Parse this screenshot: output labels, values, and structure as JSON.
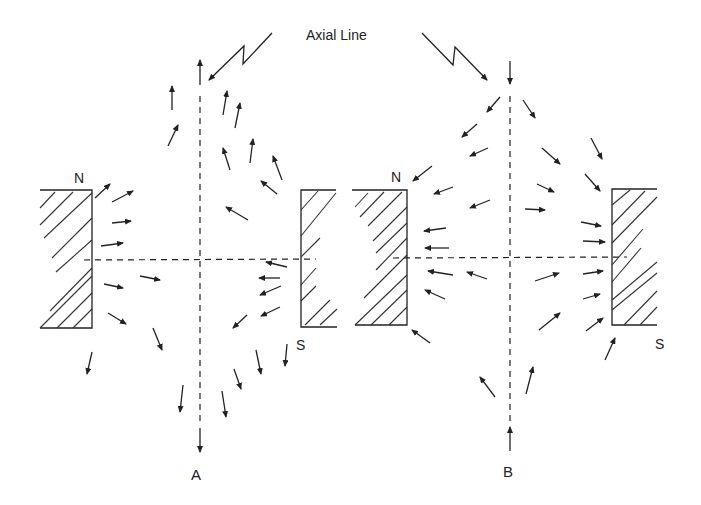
{
  "title": "Axial Line",
  "labels": {
    "axial_line": "Axial Line",
    "panel_a": "A",
    "panel_b": "B",
    "a_north": "N",
    "a_south": "S",
    "b_north": "N",
    "b_south": "S"
  },
  "colors": {
    "ink": "#222222",
    "background": "#ffffff"
  },
  "panels": [
    {
      "id": "A",
      "axis_x": 200,
      "axis_end_arrows": {
        "top": "up",
        "bottom": "down"
      },
      "magnets": [
        {
          "pole": "N",
          "x": 40,
          "y": 190,
          "w": 52,
          "h": 138,
          "open_side": "left"
        },
        {
          "pole": "S",
          "x": 300,
          "y": 190,
          "w": 35,
          "h": 137,
          "open_side": "right"
        }
      ],
      "arrows": [
        [
          95,
          198,
          110,
          184
        ],
        [
          168,
          146,
          178,
          125
        ],
        [
          172,
          110,
          172,
          86
        ],
        [
          223,
          115,
          227,
          91
        ],
        [
          235,
          128,
          240,
          103
        ],
        [
          250,
          163,
          253,
          139
        ],
        [
          230,
          170,
          223,
          148
        ],
        [
          282,
          180,
          273,
          156
        ],
        [
          112,
          202,
          133,
          191
        ],
        [
          112,
          223,
          131,
          221
        ],
        [
          101,
          246,
          123,
          243
        ],
        [
          140,
          276,
          160,
          280
        ],
        [
          104,
          284,
          123,
          288
        ],
        [
          108,
          313,
          126,
          324
        ],
        [
          153,
          328,
          162,
          350
        ],
        [
          92,
          352,
          87,
          374
        ],
        [
          183,
          385,
          180,
          412
        ],
        [
          277,
          194,
          261,
          181
        ],
        [
          248,
          220,
          226,
          207
        ],
        [
          287,
          267,
          266,
          262
        ],
        [
          280,
          278,
          259,
          278
        ],
        [
          281,
          286,
          260,
          295
        ],
        [
          280,
          307,
          261,
          316
        ],
        [
          247,
          315,
          233,
          328
        ],
        [
          287,
          344,
          285,
          366
        ],
        [
          256,
          350,
          261,
          374
        ],
        [
          234,
          369,
          241,
          389
        ],
        [
          222,
          391,
          226,
          417
        ]
      ]
    },
    {
      "id": "B",
      "axis_x": 510,
      "axis_end_arrows": {
        "top": "down",
        "bottom": "up"
      },
      "magnets": [
        {
          "pole": "N",
          "x": 355,
          "y": 189,
          "w": 52,
          "h": 136,
          "open_side": "left"
        },
        {
          "pole": "S",
          "x": 612,
          "y": 189,
          "w": 43,
          "h": 136,
          "open_side": "right"
        }
      ],
      "arrows": [
        [
          500,
          97,
          487,
          112
        ],
        [
          477,
          124,
          462,
          137
        ],
        [
          488,
          148,
          470,
          156
        ],
        [
          432,
          166,
          413,
          181
        ],
        [
          453,
          187,
          434,
          194
        ],
        [
          490,
          200,
          470,
          208
        ],
        [
          523,
          100,
          535,
          118
        ],
        [
          542,
          148,
          560,
          164
        ],
        [
          591,
          138,
          602,
          159
        ],
        [
          585,
          174,
          600,
          191
        ],
        [
          537,
          184,
          554,
          192
        ],
        [
          525,
          209,
          545,
          210
        ],
        [
          581,
          222,
          601,
          226
        ],
        [
          583,
          241,
          605,
          242
        ],
        [
          446,
          228,
          424,
          231
        ],
        [
          449,
          248,
          425,
          248
        ],
        [
          453,
          275,
          428,
          271
        ],
        [
          487,
          279,
          467,
          272
        ],
        [
          445,
          299,
          425,
          290
        ],
        [
          430,
          343,
          412,
          330
        ],
        [
          535,
          281,
          559,
          273
        ],
        [
          583,
          274,
          603,
          271
        ],
        [
          583,
          299,
          600,
          294
        ],
        [
          539,
          330,
          560,
          313
        ],
        [
          586,
          331,
          603,
          318
        ],
        [
          605,
          360,
          615,
          338
        ],
        [
          495,
          397,
          480,
          377
        ],
        [
          526,
          394,
          533,
          367
        ]
      ]
    }
  ]
}
